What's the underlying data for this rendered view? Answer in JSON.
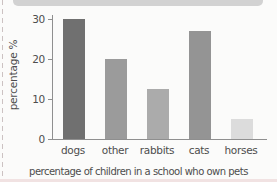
{
  "page": {
    "background": "#fbfbfa",
    "top_strip_color": "#d2d2d2",
    "edge_dash_color": "#ccc2c2",
    "bottom_strip_color": "#f1e2e2"
  },
  "chart_data": {
    "type": "bar",
    "categories": [
      "dogs",
      "other",
      "rabbits",
      "cats",
      "horses"
    ],
    "values": [
      30,
      20,
      12.5,
      27,
      5
    ],
    "bar_colors": [
      "#707070",
      "#9b9b9b",
      "#ababab",
      "#949494",
      "#dcdcdc"
    ],
    "title": "",
    "xlabel": "percentage of children in a school who own pets",
    "ylabel": "percentage %",
    "yticks": [
      0,
      10,
      20,
      30
    ],
    "ylim": [
      0,
      31
    ],
    "grid": false,
    "legend": "none",
    "axis_color": "#8f8f8f",
    "text_color": "#4d4d4d"
  }
}
